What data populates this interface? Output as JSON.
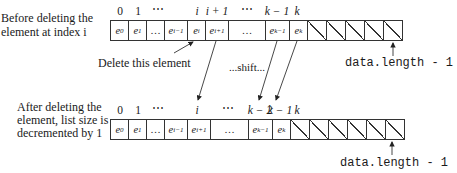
{
  "before": {
    "caption_line1": "Before deleting the",
    "caption_line2": "element at index i",
    "indices": [
      "0",
      "1",
      "⋯",
      "i",
      "i + 1",
      "⋯",
      "k − 1",
      "k"
    ],
    "cells": [
      {
        "base": "e",
        "sub": "0"
      },
      {
        "base": "e",
        "sub": "1"
      },
      {
        "base": "…",
        "sub": ""
      },
      {
        "base": "e",
        "sub": "i−1"
      },
      {
        "base": "e",
        "sub": "i"
      },
      {
        "base": "e",
        "sub": "i+1"
      },
      {
        "base": "…",
        "sub": ""
      },
      {
        "base": "e",
        "sub": "k−1"
      },
      {
        "base": "e",
        "sub": "k"
      }
    ],
    "empty_cells": 5,
    "end_label": "data.length - 1"
  },
  "annotations": {
    "delete_label": "Delete this element",
    "shift_label": "...shift..."
  },
  "after": {
    "caption_line1": "After deleting the",
    "caption_line2": "element, list size is",
    "caption_line3": "decremented by 1",
    "indices": [
      "0",
      "1",
      "⋯",
      "i",
      "⋯",
      "k − 2",
      "k − 1",
      "k"
    ],
    "cells": [
      {
        "base": "e",
        "sub": "0"
      },
      {
        "base": "e",
        "sub": "1"
      },
      {
        "base": "…",
        "sub": ""
      },
      {
        "base": "e",
        "sub": "i−1"
      },
      {
        "base": "e",
        "sub": "i+1"
      },
      {
        "base": "…",
        "sub": ""
      },
      {
        "base": "e",
        "sub": "k−1"
      },
      {
        "base": "e",
        "sub": "k"
      }
    ],
    "empty_cells": 6,
    "end_label": "data.length - 1"
  }
}
